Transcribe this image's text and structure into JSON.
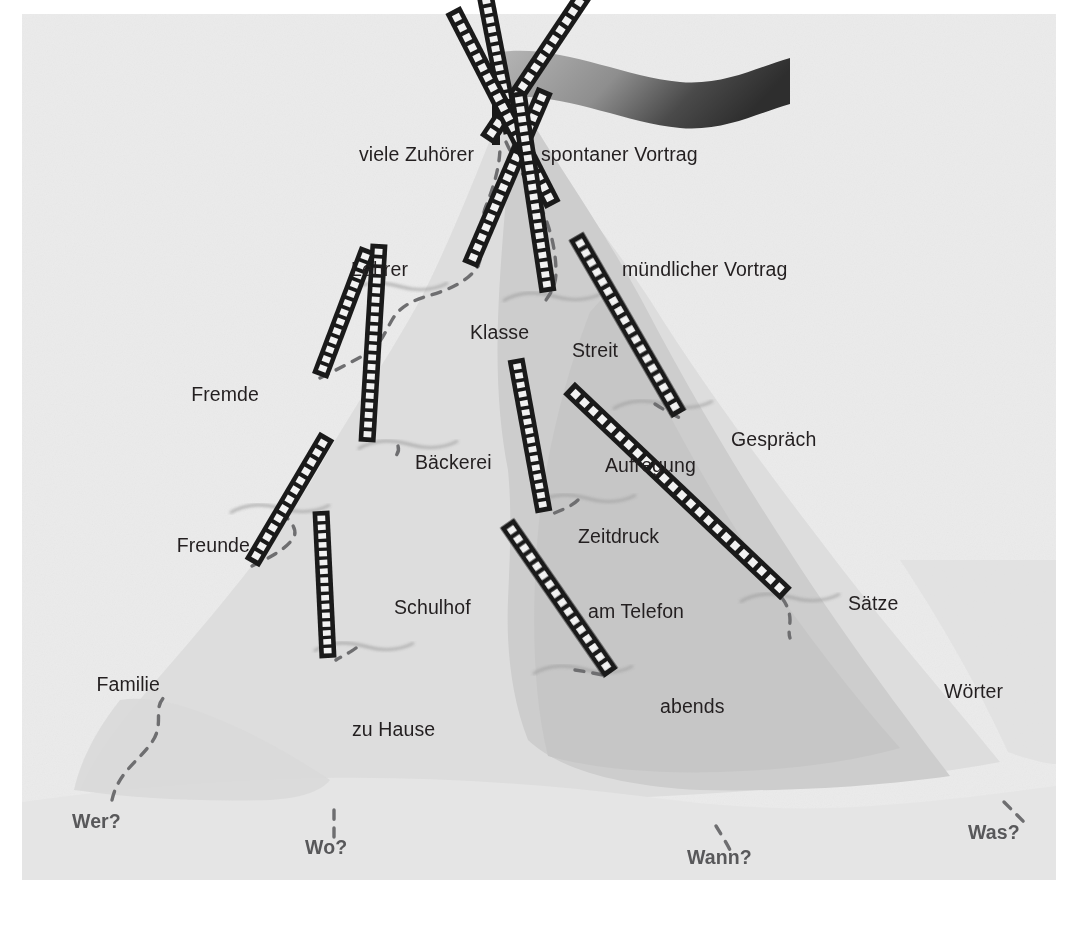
{
  "figure": {
    "background_color": "#ffffff",
    "paper_color": "#ebebeb",
    "mountain_light_color": "#dcdcdc",
    "mountain_mid_color": "#d2d2d2",
    "mountain_dark_color": "#c4c4c4",
    "foreground_color": "#e4e4e4",
    "ladder_color": "#1a1a1a",
    "rung_color": "#f2f2f2",
    "path_color": "#6e6e70",
    "label_color": "#231f20",
    "question_color": "#58585a",
    "flag": {
      "name": "summit-flag",
      "pole_color": "#1a1a1a",
      "banner_gradient_from": "#9a9a9a",
      "banner_gradient_to": "#3c3c3c"
    }
  },
  "labels": [
    {
      "id": "viele-zuhoerer",
      "text": "viele Zuhörer",
      "x": 474,
      "y": 155,
      "align": "right"
    },
    {
      "id": "spontaner-vortrag",
      "text": "spontaner Vortrag",
      "x": 541,
      "y": 155,
      "align": "left"
    },
    {
      "id": "lehrer",
      "text": "Lehrer",
      "x": 408,
      "y": 270,
      "align": "right"
    },
    {
      "id": "muendlicher-vortrag",
      "text": "mündlicher Vortrag",
      "x": 622,
      "y": 270,
      "align": "left"
    },
    {
      "id": "klasse",
      "text": "Klasse",
      "x": 470,
      "y": 333,
      "align": "left"
    },
    {
      "id": "streit",
      "text": "Streit",
      "x": 572,
      "y": 351,
      "align": "left"
    },
    {
      "id": "fremde",
      "text": "Fremde",
      "x": 259,
      "y": 395,
      "align": "right"
    },
    {
      "id": "gespraech",
      "text": "Gespräch",
      "x": 731,
      "y": 440,
      "align": "left"
    },
    {
      "id": "baeckerei",
      "text": "Bäckerei",
      "x": 415,
      "y": 463,
      "align": "left"
    },
    {
      "id": "aufregung",
      "text": "Aufregung",
      "x": 605,
      "y": 466,
      "align": "left"
    },
    {
      "id": "zeitdruck",
      "text": "Zeitdruck",
      "x": 578,
      "y": 537,
      "align": "left"
    },
    {
      "id": "freunde",
      "text": "Freunde",
      "x": 250,
      "y": 546,
      "align": "right"
    },
    {
      "id": "saetze",
      "text": "Sätze",
      "x": 848,
      "y": 604,
      "align": "left"
    },
    {
      "id": "schulhof",
      "text": "Schulhof",
      "x": 394,
      "y": 608,
      "align": "left"
    },
    {
      "id": "am-telefon",
      "text": "am Telefon",
      "x": 588,
      "y": 612,
      "align": "left"
    },
    {
      "id": "familie",
      "text": "Familie",
      "x": 160,
      "y": 685,
      "align": "right"
    },
    {
      "id": "abends",
      "text": "abends",
      "x": 660,
      "y": 707,
      "align": "left"
    },
    {
      "id": "woerter",
      "text": "Wörter",
      "x": 944,
      "y": 692,
      "align": "left"
    },
    {
      "id": "zu-hause",
      "text": "zu Hause",
      "x": 352,
      "y": 730,
      "align": "left"
    }
  ],
  "questions": [
    {
      "id": "wer",
      "text": "Wer?",
      "x": 72,
      "y": 822,
      "align": "left"
    },
    {
      "id": "wo",
      "text": "Wo?",
      "x": 305,
      "y": 848,
      "align": "left"
    },
    {
      "id": "wann",
      "text": "Wann?",
      "x": 687,
      "y": 858,
      "align": "left"
    },
    {
      "id": "was",
      "text": "Was?",
      "x": 968,
      "y": 833,
      "align": "left"
    }
  ],
  "ladders": [
    {
      "id": "ladder-viele-zuhoerer",
      "x1": 487,
      "y1": 140,
      "x2": 390,
      "y2": 285,
      "rungs": 15
    },
    {
      "id": "ladder-spontaner-vortrag",
      "x1": 512,
      "y1": 133,
      "x2": 543,
      "y2": 292,
      "rungs": 16
    },
    {
      "id": "ladder-lehrer-klasse",
      "x1": 470,
      "y1": 265,
      "x2": 395,
      "y2": 440,
      "rungs": 17
    },
    {
      "id": "ladder-muendlicher-vortrag",
      "x1": 553,
      "y1": 205,
      "x2": 653,
      "y2": 400,
      "rungs": 19
    },
    {
      "id": "ladder-streit",
      "x1": 548,
      "y1": 292,
      "x2": 578,
      "y2": 492,
      "rungs": 20
    },
    {
      "id": "ladder-fremde",
      "x1": 320,
      "y1": 376,
      "x2": 272,
      "y2": 503,
      "rungs": 13
    },
    {
      "id": "ladder-baeckerei-schulhof",
      "x1": 367,
      "y1": 442,
      "x2": 355,
      "y2": 640,
      "rungs": 20
    },
    {
      "id": "ladder-gespraech",
      "x1": 679,
      "y1": 414,
      "x2": 782,
      "y2": 592,
      "rungs": 18
    },
    {
      "id": "ladder-zeitdruck",
      "x1": 544,
      "y1": 512,
      "x2": 572,
      "y2": 665,
      "rungs": 16
    },
    {
      "id": "ladder-freunde",
      "x1": 252,
      "y1": 563,
      "x2": 177,
      "y2": 690,
      "rungs": 13
    },
    {
      "id": "ladder-saetze-woerter",
      "x1": 786,
      "y1": 594,
      "x2": 1003,
      "y2": 800,
      "rungs": 24
    },
    {
      "id": "ladder-zu-hause",
      "x1": 328,
      "y1": 658,
      "x2": 335,
      "y2": 805,
      "rungs": 16
    },
    {
      "id": "ladder-abends",
      "x1": 611,
      "y1": 673,
      "x2": 715,
      "y2": 823,
      "rungs": 16
    }
  ],
  "ledges": [
    {
      "id": "ledge-lehrer",
      "x": 390,
      "y": 285
    },
    {
      "id": "ledge-klasse",
      "x": 400,
      "y": 443
    },
    {
      "id": "ledge-streit",
      "x": 545,
      "y": 295
    },
    {
      "id": "ledge-aufregung",
      "x": 578,
      "y": 497
    },
    {
      "id": "ledge-baeckerei",
      "x": 272,
      "y": 507
    },
    {
      "id": "ledge-schulhof",
      "x": 356,
      "y": 645
    },
    {
      "id": "ledge-telefon",
      "x": 575,
      "y": 668
    },
    {
      "id": "ledge-gespraech",
      "x": 782,
      "y": 596
    },
    {
      "id": "ledge-vortrag",
      "x": 655,
      "y": 403
    }
  ]
}
